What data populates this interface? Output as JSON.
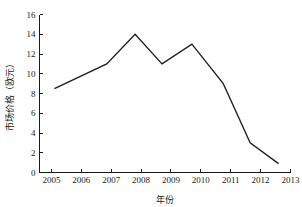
{
  "chart_data": {
    "type": "line",
    "title": "",
    "xlabel": "年份",
    "ylabel": "市场价格（欧元）",
    "xlim": [
      2004.6,
      2013.0
    ],
    "ylim": [
      0,
      16
    ],
    "grid": false,
    "legend": false,
    "x_tick_labels": [
      "2005",
      "2006",
      "2007",
      "2008",
      "2009",
      "2010",
      "2011",
      "2012",
      "2013"
    ],
    "x_ticks": [
      2005,
      2006,
      2007,
      2008,
      2009,
      2010,
      2011,
      2012,
      2013
    ],
    "y_tick_labels": [
      "0",
      "2",
      "4",
      "6",
      "8",
      "10",
      "12",
      "14",
      "16"
    ],
    "y_ticks": [
      0,
      2,
      4,
      6,
      8,
      10,
      12,
      14,
      16
    ],
    "series": [
      {
        "name": "市场价格",
        "color": "#1c1c1c",
        "x": [
          2005.1,
          2006.85,
          2007.8,
          2008.7,
          2009.7,
          2010.75,
          2011.65,
          2012.6
        ],
        "values": [
          8.5,
          11.0,
          14.0,
          11.0,
          13.0,
          9.0,
          3.0,
          0.9
        ]
      }
    ]
  }
}
